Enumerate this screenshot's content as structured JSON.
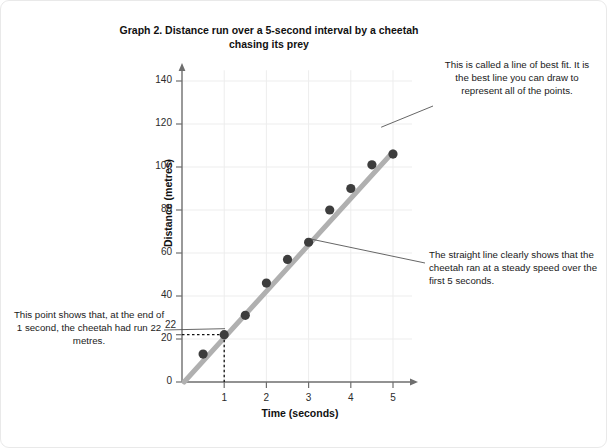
{
  "chart_data": {
    "type": "scatter",
    "title": "Graph 2. Distance run over a 5-second interval by a cheetah chasing its prey",
    "xlabel": "Time (seconds)",
    "ylabel": "Distance (metres)",
    "x": [
      0.5,
      1.0,
      1.5,
      2.0,
      2.5,
      3.0,
      3.5,
      4.0,
      4.5,
      5.0
    ],
    "values": [
      13,
      22,
      31,
      46,
      57,
      65,
      80,
      90,
      101,
      106
    ],
    "xlim": [
      0,
      5.5
    ],
    "ylim": [
      0,
      145
    ],
    "xticks": [
      "1",
      "2",
      "3",
      "4",
      "5"
    ],
    "yticks": [
      "0",
      "20",
      "40",
      "60",
      "80",
      "100",
      "120",
      "140"
    ],
    "grid": true,
    "legend": "none",
    "trendline": {
      "name": "line of best fit",
      "x_start": 0.05,
      "y_start": 0,
      "x_end": 5.0,
      "y_end": 107,
      "color": "#b0b0b0"
    },
    "highlight_point": {
      "x": 1,
      "y": 22,
      "y_label": "22",
      "guide_style": "dotted"
    },
    "point_color": "#3d3d3d",
    "annotations": [
      "This is called a line of best fit. It is the best line you can draw to represent all of the points.",
      "The straight line clearly shows that the cheetah ran at a steady speed over the first 5 seconds.",
      "This point shows that, at the end of 1 second, the cheetah had run 22  metres."
    ]
  },
  "title": {
    "text": "Graph 2. Distance run over a 5-second interval by a cheetah chasing its prey"
  },
  "axes": {
    "y_title": "Distance (metres)",
    "x_title": "Time (seconds)",
    "y_ticks": [
      "140",
      "120",
      "100",
      "80",
      "60",
      "40",
      "20",
      "0"
    ],
    "x_ticks": [
      "1",
      "2",
      "3",
      "4",
      "5"
    ],
    "special_y_label": "22"
  },
  "annotations": {
    "best_fit": "This is called a line of best fit. It is the best line you can draw to represent all of the points.",
    "steady_speed": "The straight line clearly shows that the cheetah ran at a steady speed over the first 5 seconds.",
    "point_value": "This point shows that, at the end of 1 second, the cheetah had run 22  metres."
  },
  "colors": {
    "point": "#3d3d3d",
    "trendline": "#b0b0b0",
    "axis": "#6e6e6e",
    "grid": "#ededed"
  }
}
